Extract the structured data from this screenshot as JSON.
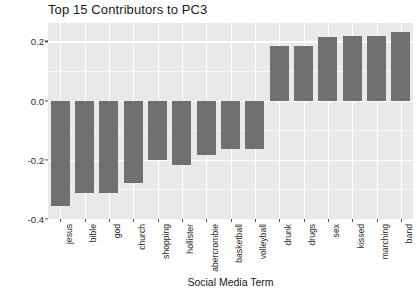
{
  "chart_data": {
    "type": "bar",
    "title": "Top 15 Contributors to PC3",
    "xlabel": "Social Media Term",
    "ylabel": "Relative Importance to Principal Component",
    "categories": [
      "jesus",
      "bible",
      "god",
      "church",
      "shopping",
      "hollister",
      "abercrombie",
      "basketball",
      "volleyball",
      "drunk",
      "drugs",
      "sex",
      "kissed",
      "marching",
      "band"
    ],
    "values": [
      -0.355,
      -0.313,
      -0.313,
      -0.279,
      -0.2,
      -0.217,
      -0.183,
      -0.165,
      -0.165,
      0.186,
      0.186,
      0.214,
      0.217,
      0.217,
      0.231
    ],
    "ylim": [
      -0.4,
      0.262
    ],
    "yticks": [
      0.2,
      0.0,
      -0.2,
      -0.4
    ],
    "ytick_labels": [
      "0.2",
      "0.0",
      "-0.2",
      "-0.4"
    ],
    "grid": true,
    "legend": "none",
    "bar_color": "#707070",
    "panel_color": "#e9e9e9",
    "gridline_color": "#ffffff"
  }
}
